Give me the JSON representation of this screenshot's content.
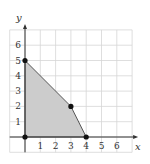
{
  "chart_data": {
    "type": "area",
    "title": "",
    "xlabel": "x",
    "ylabel": "y",
    "xlim": [
      -1,
      7
    ],
    "ylim": [
      -1,
      7
    ],
    "grid": true,
    "x_ticks": [
      "1",
      "2",
      "3",
      "4",
      "5",
      "6"
    ],
    "y_ticks": [
      "1",
      "2",
      "3",
      "4",
      "5",
      "6"
    ],
    "region": {
      "description": "shaded feasible region (polygon)",
      "vertices": [
        [
          0,
          0
        ],
        [
          0,
          5
        ],
        [
          3,
          2
        ],
        [
          4,
          0
        ]
      ],
      "fill_color": "#cccccc"
    },
    "points": [
      {
        "x": 0,
        "y": 0
      },
      {
        "x": 0,
        "y": 5
      },
      {
        "x": 3,
        "y": 2
      },
      {
        "x": 4,
        "y": 0
      }
    ]
  },
  "colors": {
    "grid": "#d6d6d6",
    "axis": "#333333",
    "region_fill": "#cccccc",
    "region_edge": "#555555",
    "point": "#111111"
  }
}
